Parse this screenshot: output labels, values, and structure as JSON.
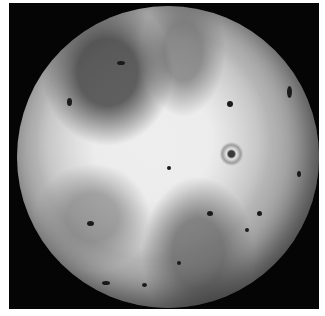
{
  "image": {
    "subject": "Io (moon of Jupiter), grayscale full-disk photograph",
    "background_color": "#050505",
    "border_color": "#ffffff"
  }
}
